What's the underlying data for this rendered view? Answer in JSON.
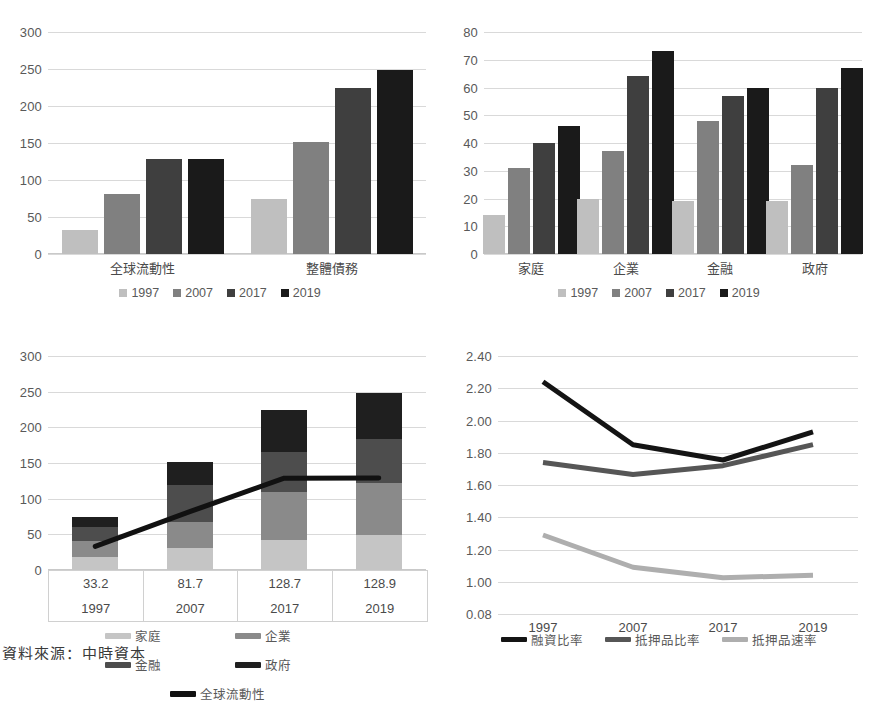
{
  "palette": {
    "s1997": "#bfbfbf",
    "s2007": "#808080",
    "s2017": "#3f3f3f",
    "s2019": "#1a1a1a",
    "gridline": "#d9d9d9",
    "axis": "#c9c9c9",
    "text": "#4a4a4a"
  },
  "caption": {
    "text": "資料來源：中時資本"
  },
  "chart_data": [
    {
      "id": "chart-top-left",
      "type": "bar",
      "title": "",
      "xlabel": "",
      "ylabel": "",
      "categories": [
        "全球流動性",
        "整體債務"
      ],
      "series": [
        {
          "name": "1997",
          "color": "#bfbfbf",
          "values": [
            33,
            75
          ]
        },
        {
          "name": "2007",
          "color": "#808080",
          "values": [
            81,
            151
          ]
        },
        {
          "name": "2017",
          "color": "#3f3f3f",
          "values": [
            128,
            224
          ]
        },
        {
          "name": "2019",
          "color": "#1a1a1a",
          "values": [
            129,
            248
          ]
        }
      ],
      "ylim": [
        0,
        300
      ],
      "yticks": [
        0,
        50,
        100,
        150,
        200,
        250,
        300
      ],
      "grid": true,
      "legend_position": "bottom"
    },
    {
      "id": "chart-top-right",
      "type": "bar",
      "title": "",
      "xlabel": "",
      "ylabel": "",
      "categories": [
        "家庭",
        "企業",
        "金融",
        "政府"
      ],
      "series": [
        {
          "name": "1997",
          "color": "#bfbfbf",
          "values": [
            14,
            20,
            19,
            19
          ]
        },
        {
          "name": "2007",
          "color": "#808080",
          "values": [
            31,
            37,
            48,
            32
          ]
        },
        {
          "name": "2017",
          "color": "#3f3f3f",
          "values": [
            40,
            64,
            57,
            60
          ]
        },
        {
          "name": "2019",
          "color": "#1a1a1a",
          "values": [
            46,
            73,
            60,
            67
          ]
        }
      ],
      "ylim": [
        0,
        80
      ],
      "yticks": [
        0,
        10,
        20,
        30,
        40,
        50,
        60,
        70,
        80
      ],
      "grid": true,
      "legend_position": "bottom"
    },
    {
      "id": "chart-bottom-left",
      "type": "bar",
      "stacked": true,
      "title": "",
      "xlabel": "",
      "ylabel": "",
      "categories": [
        "1997",
        "2007",
        "2017",
        "2019"
      ],
      "series": [
        {
          "name": "家庭",
          "color": "#c5c5c5",
          "values": [
            18,
            31,
            42,
            49
          ]
        },
        {
          "name": "企業",
          "color": "#8a8a8a",
          "values": [
            22,
            36,
            67,
            73
          ]
        },
        {
          "name": "金融",
          "color": "#4d4d4d",
          "values": [
            20,
            52,
            57,
            61
          ]
        },
        {
          "name": "政府",
          "color": "#1f1f1f",
          "values": [
            15,
            32,
            58,
            65
          ]
        }
      ],
      "line_series": {
        "name": "全球流動性",
        "color": "#111111",
        "values": [
          33.2,
          81.7,
          128.7,
          128.9
        ]
      },
      "ylim": [
        0,
        300
      ],
      "yticks": [
        0,
        50,
        100,
        150,
        200,
        250,
        300
      ],
      "grid": true,
      "legend_position": "bottom",
      "data_table": {
        "rows": [
          [
            "33.2",
            "81.7",
            "128.7",
            "128.9"
          ],
          [
            "1997",
            "2007",
            "2017",
            "2019"
          ]
        ]
      }
    },
    {
      "id": "chart-bottom-right",
      "type": "line",
      "title": "",
      "xlabel": "",
      "ylabel": "",
      "x": [
        "1997",
        "2007",
        "2017",
        "2019"
      ],
      "series": [
        {
          "name": "融資比率",
          "color": "#141414",
          "values": [
            2.24,
            1.85,
            1.755,
            1.93
          ]
        },
        {
          "name": "抵押品比率",
          "color": "#565656",
          "values": [
            1.74,
            1.665,
            1.72,
            1.85
          ]
        },
        {
          "name": "抵押品速率",
          "color": "#aeaeae",
          "values": [
            1.29,
            1.09,
            1.025,
            1.04
          ]
        }
      ],
      "ylim": [
        0.8,
        2.4
      ],
      "yticks": [
        "0.08",
        "1.00",
        "1.20",
        "1.40",
        "1.60",
        "1.80",
        "2.00",
        "2.20",
        "2.40"
      ],
      "grid": true,
      "legend_position": "bottom"
    }
  ]
}
